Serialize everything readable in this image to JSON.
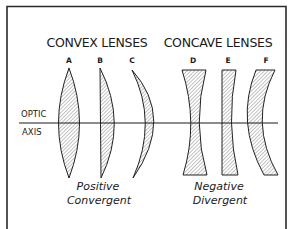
{
  "diagram": {
    "frame": {
      "border_color": "#2a2a2a"
    },
    "groups": [
      {
        "heading": "CONVEX LENSES",
        "caption_line1": "Positive",
        "caption_line2": "Convergent",
        "lenses": [
          {
            "label": "A",
            "type": "biconvex"
          },
          {
            "label": "B",
            "type": "plano-convex"
          },
          {
            "label": "C",
            "type": "convex-meniscus"
          }
        ]
      },
      {
        "heading": "CONCAVE LENSES",
        "caption_line1": "Negative",
        "caption_line2": "Divergent",
        "lenses": [
          {
            "label": "D",
            "type": "biconcave"
          },
          {
            "label": "E",
            "type": "plano-concave"
          },
          {
            "label": "F",
            "type": "concave-meniscus"
          }
        ]
      }
    ],
    "axis": {
      "label_line1": "OPTIC",
      "label_line2": "AXIS"
    },
    "colors": {
      "ink": "#1a1a1a",
      "hatch": "#555555",
      "background": "#ffffff"
    }
  }
}
